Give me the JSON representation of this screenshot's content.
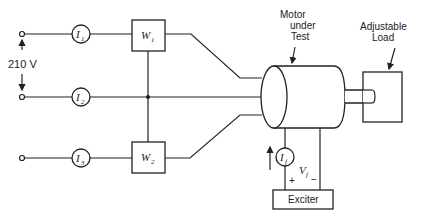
{
  "diagram": {
    "type": "circuit-schematic",
    "source": {
      "voltage_label": "210 V"
    },
    "meters": [
      {
        "id": "I1",
        "symbol": "I",
        "subscript": "1"
      },
      {
        "id": "I2",
        "symbol": "I",
        "subscript": "2"
      },
      {
        "id": "I3",
        "symbol": "I",
        "subscript": "3"
      },
      {
        "id": "If",
        "symbol": "I",
        "subscript": "f"
      }
    ],
    "wattmeters": [
      {
        "id": "W1",
        "symbol": "W",
        "subscript": "1"
      },
      {
        "id": "W2",
        "symbol": "W",
        "subscript": "2"
      }
    ],
    "motor": {
      "label_line1": "Motor",
      "label_line2": "under",
      "label_line3": "Test"
    },
    "load": {
      "label_line1": "Adjustable",
      "label_line2": "Load"
    },
    "exciter": {
      "label": "Exciter"
    },
    "field_voltage": {
      "symbol": "V",
      "subscript": "f",
      "plus": "+",
      "minus": "−"
    }
  }
}
